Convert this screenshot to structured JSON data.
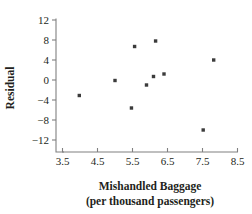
{
  "chart_data": {
    "type": "scatter",
    "title": "",
    "xlabel": "Mishandled Baggage",
    "xlabel_line2": "(per thousand passengers)",
    "ylabel": "Residual",
    "xlim": [
      3.5,
      8.5
    ],
    "ylim": [
      -12,
      12
    ],
    "xticks": [
      "3.5",
      "4.5",
      "5.5",
      "6.5",
      "7.5",
      "8.5"
    ],
    "xtick_values": [
      3.5,
      4.5,
      5.5,
      6.5,
      7.5,
      8.5
    ],
    "yticks": [
      "12",
      "8",
      "4",
      "0",
      "−4",
      "−8",
      "−12"
    ],
    "ytick_values": [
      12,
      8,
      4,
      0,
      -4,
      -8,
      -12
    ],
    "grid": false,
    "legend": "none",
    "marker_color": "#3b3b3b",
    "axis_color": "#808080",
    "points": [
      {
        "x": 3.98,
        "y": -3.1
      },
      {
        "x": 5.0,
        "y": -0.1
      },
      {
        "x": 5.47,
        "y": -5.6
      },
      {
        "x": 5.56,
        "y": 6.7
      },
      {
        "x": 5.9,
        "y": -1.0
      },
      {
        "x": 6.1,
        "y": 0.7
      },
      {
        "x": 6.16,
        "y": 7.8
      },
      {
        "x": 6.4,
        "y": 1.2
      },
      {
        "x": 7.52,
        "y": -10.0
      },
      {
        "x": 7.82,
        "y": 4.0
      }
    ]
  }
}
